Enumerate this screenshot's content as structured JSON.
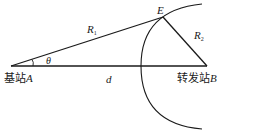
{
  "diagram": {
    "points": {
      "A": {
        "name": "A",
        "station_label": "基站"
      },
      "B": {
        "name": "B",
        "station_label": "转发站"
      },
      "E": {
        "name": "E"
      }
    },
    "segments": {
      "AE": {
        "label": "R",
        "sub": "1"
      },
      "EB": {
        "label": "R",
        "sub": "2"
      },
      "AB": {
        "label": "d"
      }
    },
    "angle": {
      "label": "θ",
      "vertex": "A"
    },
    "labels": {
      "base_station_A": "基站",
      "base_station_A_letter": "A",
      "relay_station_B": "转发站",
      "relay_station_B_letter": "B",
      "point_E": "E",
      "R1_main": "R",
      "R1_sub": "1",
      "R2_main": "R",
      "R2_sub": "2",
      "d": "d",
      "theta": "θ"
    },
    "colors": {
      "stroke": "#1a1a1a",
      "background": "#ffffff"
    }
  }
}
